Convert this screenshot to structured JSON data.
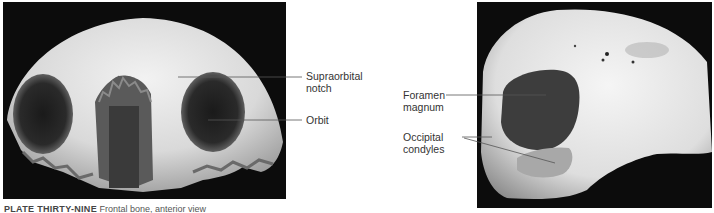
{
  "figure": {
    "left_photo": {
      "subject": "skull anterior view",
      "labels": [
        {
          "text": "Supraorbital notch",
          "line1": "Supraorbital",
          "line2": "notch"
        },
        {
          "text": "Orbit",
          "line1": "Orbit"
        }
      ]
    },
    "right_photo": {
      "subject": "skull inferior view",
      "labels": [
        {
          "text": "Foramen magnum",
          "line1": "Foramen",
          "line2": "magnum"
        },
        {
          "text": "Occipital condyles",
          "line1": "Occipital",
          "line2": "condyles"
        }
      ]
    },
    "caption": {
      "plate": "PLATE THIRTY-NINE",
      "text": "Frontal bone, anterior view"
    },
    "colors": {
      "background": "#ffffff",
      "photo_bg": "#0c0c0c",
      "bone": "#e6e6e6",
      "label_text": "#333333",
      "leader_line": "#555555"
    }
  }
}
